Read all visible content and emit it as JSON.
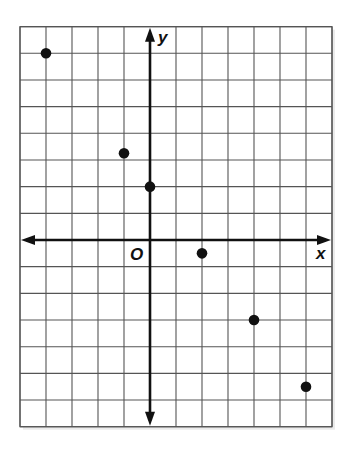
{
  "chart_data": {
    "type": "scatter",
    "title": "",
    "xlabel": "x",
    "ylabel": "y",
    "origin_label": "O",
    "xlim": [
      -5,
      7
    ],
    "ylim": [
      -7,
      8
    ],
    "grid": true,
    "grid_step": 1,
    "tick_labels_shown": false,
    "legend": null,
    "points": [
      {
        "x": -4,
        "y": 7
      },
      {
        "x": -1,
        "y": 3.25
      },
      {
        "x": 0,
        "y": 2
      },
      {
        "x": 2,
        "y": -0.5
      },
      {
        "x": 4,
        "y": -3
      },
      {
        "x": 6,
        "y": -5.5
      }
    ],
    "x": [
      -4,
      -1,
      0,
      2,
      4,
      6
    ],
    "y": [
      7,
      3.25,
      2,
      -0.5,
      -3,
      -5.5
    ]
  },
  "layout": {
    "origin_px": [
      150,
      240
    ],
    "unit_x_px": 26,
    "unit_y_px": 26.67,
    "colors": {
      "grid": "#555555",
      "axis": "#111111",
      "point": "#111111",
      "shadow": "#dddddd"
    }
  }
}
